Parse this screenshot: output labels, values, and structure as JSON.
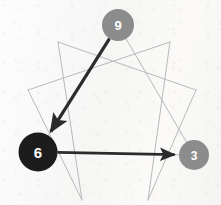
{
  "diagram": {
    "type": "enneagram",
    "background_color": "#fafaf9",
    "line_color": "#b9b9b9",
    "arrow_color": "#2b2b2b",
    "canvas": {
      "width": 221,
      "height": 205
    },
    "points": [
      {
        "id": "p9",
        "label": "9",
        "x": 118,
        "y": 25,
        "visible": true
      },
      {
        "id": "p1",
        "label": "1",
        "x": 170,
        "y": 42,
        "visible": false
      },
      {
        "id": "p2",
        "label": "2",
        "x": 196,
        "y": 90,
        "visible": false
      },
      {
        "id": "p3",
        "label": "3",
        "x": 194,
        "y": 155,
        "visible": true
      },
      {
        "id": "p4",
        "label": "4",
        "x": 148,
        "y": 200,
        "visible": false
      },
      {
        "id": "p5",
        "label": "5",
        "x": 82,
        "y": 200,
        "visible": false
      },
      {
        "id": "p6",
        "label": "6",
        "x": 38,
        "y": 152,
        "visible": true
      },
      {
        "id": "p7",
        "label": "7",
        "x": 28,
        "y": 90,
        "visible": false
      },
      {
        "id": "p8",
        "label": "8",
        "x": 58,
        "y": 42,
        "visible": false
      }
    ],
    "nodes": [
      {
        "id": "node-9",
        "label": "9",
        "cx": 118,
        "cy": 25,
        "r": 16,
        "fill": "#8c8c8c",
        "text_color": "#ffffff",
        "font_size": 13
      },
      {
        "id": "node-6",
        "label": "6",
        "cx": 38,
        "cy": 152,
        "r": 19.5,
        "fill": "#1c1c1c",
        "text_color": "#ffffff",
        "font_size": 15
      },
      {
        "id": "node-3",
        "label": "3",
        "cx": 194,
        "cy": 155,
        "r": 15,
        "fill": "#8c8c8c",
        "text_color": "#ffffff",
        "font_size": 12
      }
    ],
    "gray_lines": [
      {
        "id": "tri-9-6",
        "from": "p9",
        "to": "p6"
      },
      {
        "id": "tri-6-3",
        "from": "p6",
        "to": "p3"
      },
      {
        "id": "tri-3-9",
        "from": "p3",
        "to": "p9"
      },
      {
        "id": "hex-1-4",
        "from": "p1",
        "to": "p4"
      },
      {
        "id": "hex-4-2",
        "from": "p4",
        "to": "p2"
      },
      {
        "id": "hex-2-8",
        "from": "p2",
        "to": "p8"
      },
      {
        "id": "hex-8-5",
        "from": "p8",
        "to": "p5"
      },
      {
        "id": "hex-5-7",
        "from": "p5",
        "to": "p7"
      },
      {
        "id": "hex-7-1",
        "from": "p7",
        "to": "p1"
      }
    ],
    "arrows": [
      {
        "id": "arrow-9-6",
        "from": "p9",
        "to": "p6",
        "label": "9 to 6",
        "color": "#2b2b2b",
        "width": 3.2
      },
      {
        "id": "arrow-6-3",
        "from": "p6",
        "to": "p3",
        "label": "6 to 3",
        "color": "#2b2b2b",
        "width": 2.6
      }
    ]
  }
}
